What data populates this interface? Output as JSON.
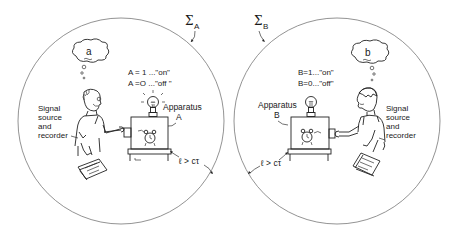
{
  "figure": {
    "regions": [
      {
        "id": "A",
        "boundary_label": "Σ",
        "boundary_subscript": "A",
        "thought": "a",
        "state_on": "A = 1 ...\"on\"",
        "state_off": "A =O ...\"off \"",
        "apparatus_label_1": "Apparatus",
        "apparatus_label_2": "A",
        "observer_label": [
          "Signal",
          "source",
          "and",
          "recorder"
        ],
        "distance_label": "ℓ > cτ"
      },
      {
        "id": "B",
        "boundary_label": "Σ",
        "boundary_subscript": "B",
        "thought": "b",
        "state_on": "B=1...\"on\"",
        "state_off": "B=0...\"off\"",
        "apparatus_label_1": "Apparatus",
        "apparatus_label_2": "B",
        "observer_label": [
          "Signal",
          "source",
          "and",
          "recorder"
        ],
        "distance_label": "ℓ > cτ"
      }
    ],
    "icons": {
      "bulb": "light-bulb-icon",
      "clock": "alarm-clock-icon",
      "notebook": "notebook-icon",
      "person": "person-figure"
    },
    "colors": {
      "ink": "#1a1a1a",
      "boundary": "#777777",
      "background": "#ffffff"
    }
  }
}
